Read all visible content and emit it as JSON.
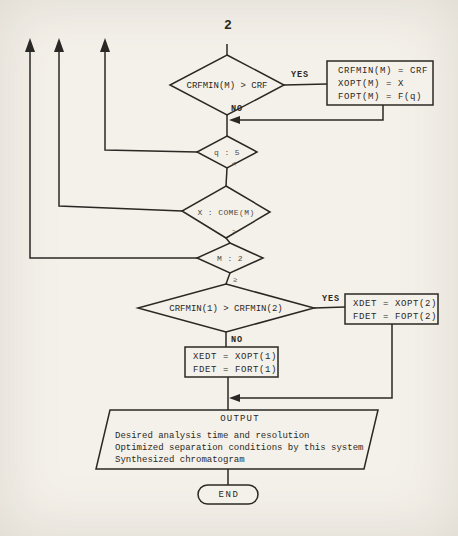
{
  "colors": {
    "paper": "#f4f1ea",
    "ink": "#2b2822"
  },
  "connector": {
    "label": "2"
  },
  "d1": {
    "label": "CRFMIN(M) > CRF",
    "yes": "YES",
    "no": "NO"
  },
  "box1": {
    "line1": "CRFMIN(M) = CRF",
    "line2": "XOPT(M) = X",
    "line3": "FOPT(M) = F(q)"
  },
  "d2": {
    "label": "q : 5",
    "mark": "<"
  },
  "d3": {
    "label": "X : COME(M)",
    "mark": ">"
  },
  "d4": {
    "label": "M : 2",
    "mark": "≥"
  },
  "d5": {
    "label": "CRFMIN(1) > CRFMIN(2)",
    "yes": "YES",
    "no": "NO"
  },
  "box2": {
    "line1": "XDET = XOPT(2)",
    "line2": "FDET = FOPT(2)"
  },
  "box3": {
    "line1": "XEDT = XOPT(1)",
    "line2": "FDET = FORT(1)"
  },
  "output": {
    "title": "OUTPUT",
    "line1": "Desired analysis time and resolution",
    "line2": "Optimized separation conditions by this system",
    "line3": "Synthesized chromatogram"
  },
  "end": {
    "label": "END"
  }
}
